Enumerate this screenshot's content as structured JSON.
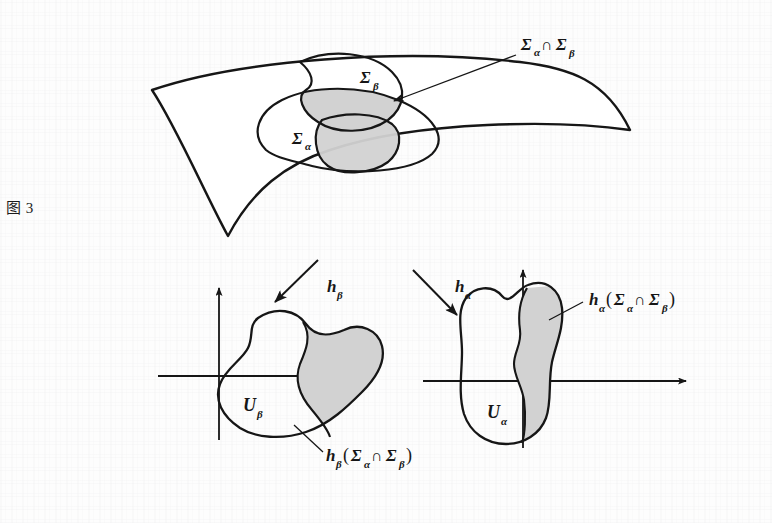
{
  "figure": {
    "caption": "图 3",
    "colors": {
      "ink": "#161616",
      "paper": "#fdfdfd",
      "shade_fill": "#d2d2d2",
      "region_fill": "#ffffff"
    }
  },
  "manifold": {
    "name": "curved-surface-patch",
    "regions": [
      {
        "id": "sigma-alpha",
        "label": "Σ",
        "subscript": "α"
      },
      {
        "id": "sigma-beta",
        "label": "Σ",
        "subscript": "β"
      }
    ],
    "intersection": {
      "id": "sigma-alpha-cap-sigma-beta",
      "label": "Σ",
      "sub1": "α",
      "op": "∩",
      "label2": "Σ",
      "sub2": "β",
      "full": "Σα∩Σβ"
    }
  },
  "maps": {
    "h_beta": {
      "label": "h",
      "subscript": "β",
      "full": "hβ"
    },
    "h_alpha": {
      "label": "h",
      "subscript": "α",
      "full": "hα"
    }
  },
  "chart_left": {
    "id": "chart-u-beta",
    "domain_label": "U",
    "domain_subscript": "β",
    "image_label": {
      "fn": "h",
      "fn_sub": "β",
      "open": "(",
      "s1": "Σ",
      "s1_sub": "α",
      "op": "∩",
      "s2": "Σ",
      "s2_sub": "β",
      "close": ")",
      "full": "hβ(Σα∩Σβ)"
    }
  },
  "chart_right": {
    "id": "chart-u-alpha",
    "domain_label": "U",
    "domain_subscript": "α",
    "image_label": {
      "fn": "h",
      "fn_sub": "α",
      "open": "(",
      "s1": "Σ",
      "s1_sub": "α",
      "op": "∩",
      "s2": "Σ",
      "s2_sub": "β",
      "close": ")",
      "full": "hα(Σα∩Σβ)"
    }
  }
}
